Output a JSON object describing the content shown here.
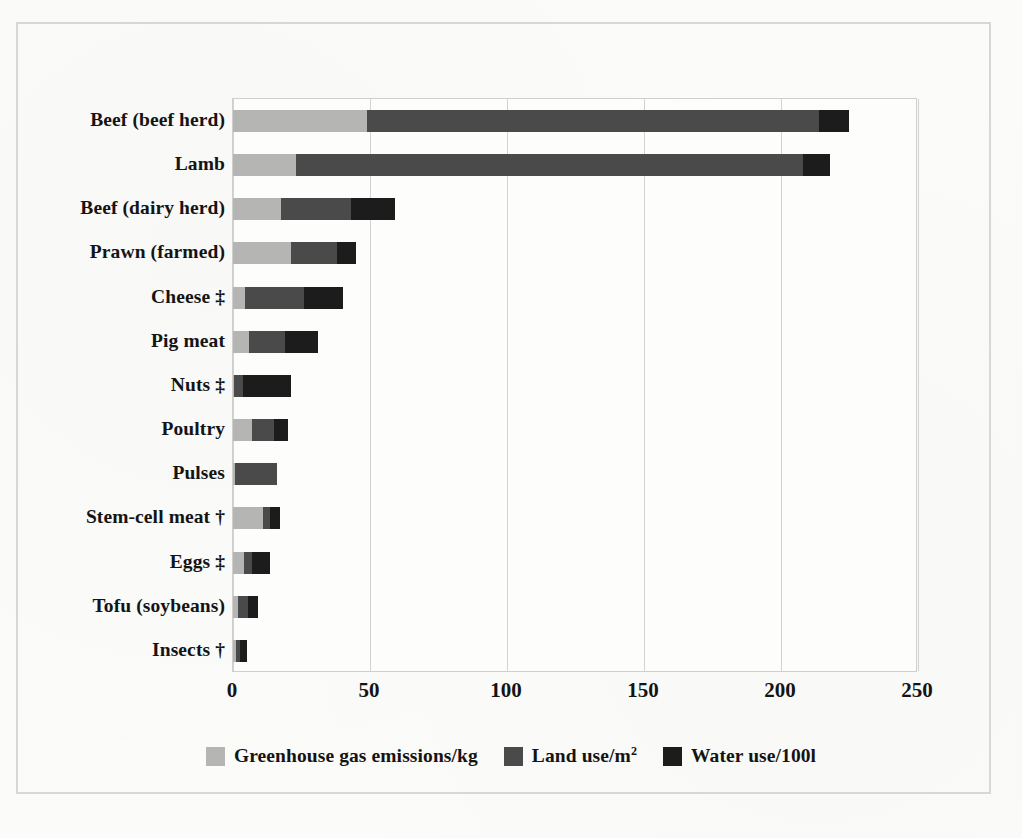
{
  "chart_data": {
    "type": "bar",
    "orientation": "horizontal",
    "stacked": true,
    "title": "",
    "xlabel": "",
    "ylabel": "",
    "xlim": [
      0,
      250
    ],
    "xticks": [
      0,
      50,
      100,
      150,
      200,
      250
    ],
    "grid": true,
    "legend_position": "bottom",
    "categories": [
      "Beef (beef herd)",
      "Lamb",
      "Beef (dairy herd)",
      "Prawn (farmed)",
      "Cheese ‡",
      "Pig meat",
      "Nuts ‡",
      "Poultry",
      "Pulses",
      "Stem-cell meat †",
      "Eggs ‡",
      "Tofu (soybeans)",
      "Insects †"
    ],
    "series": [
      {
        "name": "Greenhouse gas emissions/kg",
        "color": "#b5b6b4",
        "values": [
          49,
          23,
          17.5,
          21,
          4.5,
          6,
          0.5,
          7,
          0.8,
          11,
          4,
          2,
          1
        ]
      },
      {
        "name": "Land use/m²",
        "color": "#494a49",
        "values": [
          165,
          185,
          25.5,
          17,
          21.5,
          13,
          3,
          8,
          15.2,
          2.5,
          3,
          3.5,
          1.5
        ]
      },
      {
        "name": "Water use/100l",
        "color": "#1b1c1b",
        "values": [
          11,
          10,
          16,
          7,
          14,
          12,
          17.5,
          5,
          0,
          3.5,
          6.5,
          3.5,
          2.5
        ]
      }
    ],
    "totals": [
      225,
      218,
      59,
      45,
      40,
      31,
      21,
      20,
      16,
      17,
      13.5,
      9,
      5
    ]
  },
  "legend": {
    "items": [
      {
        "label": "Greenhouse gas emissions/kg",
        "color": "#b5b6b4",
        "superscript": ""
      },
      {
        "label": "Land use/m",
        "color": "#494a49",
        "superscript": "2"
      },
      {
        "label": "Water use/100l",
        "color": "#1b1c1b",
        "superscript": ""
      }
    ]
  },
  "axis": {
    "xtick_labels": [
      "0",
      "50",
      "100",
      "150",
      "200",
      "250"
    ]
  }
}
